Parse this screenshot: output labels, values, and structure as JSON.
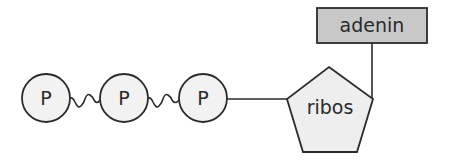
{
  "diagram": {
    "phosphates": [
      {
        "label": "P",
        "cx": 46,
        "cy": 98
      },
      {
        "label": "P",
        "cx": 124,
        "cy": 98
      },
      {
        "label": "P",
        "cx": 203,
        "cy": 98
      }
    ],
    "sugar": {
      "label": "ribos"
    },
    "base": {
      "label": "adenin"
    },
    "colors": {
      "stroke": "#2b2b2b",
      "phosphate_fill": "#f2f2f2",
      "sugar_fill": "#eeeeee",
      "base_fill": "#c8c8c8"
    }
  }
}
